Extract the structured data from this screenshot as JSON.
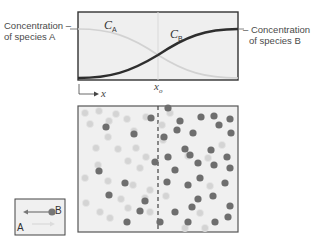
{
  "graph": {
    "label_a_line1": "Concentration –",
    "label_a_line2": "of species A",
    "label_b_line1": "– Concentration",
    "label_b_line2": "of species B",
    "curve_a_label": "C",
    "curve_a_sub": "A",
    "curve_b_label": "C",
    "curve_b_sub": "B",
    "xo_label": "x",
    "xo_sub": "o",
    "axis_label": "x"
  },
  "particles": {
    "divider": "dashed interface at x_o",
    "left_light_count": 27,
    "left_dark_count": 9,
    "right_dark_count": 33,
    "right_light_count": 11
  },
  "legend": {
    "b_label": "B",
    "a_label": "A"
  },
  "colors": {
    "species_a": "#d4d4d4",
    "species_b": "#6e6e6e",
    "curve_b": "#2e2e2e",
    "curve_a": "#d0d0d0",
    "box_fill": "#efefef",
    "border": "#3a3a3a"
  }
}
